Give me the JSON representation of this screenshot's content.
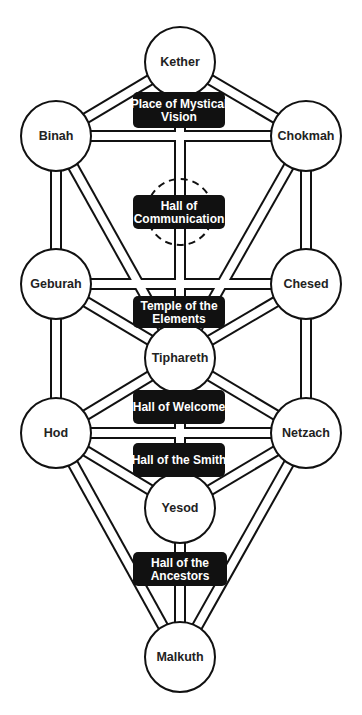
{
  "diagram": {
    "colors": {
      "line": "#111111",
      "fill": "#ffffff",
      "label_bg": "#111111",
      "label_text": "#ffffff",
      "node_text": "#222222"
    },
    "tube": {
      "outer_width": 12,
      "inner_width": 8
    },
    "nodes": [
      {
        "id": "kether",
        "label": "Kether",
        "cx": 180,
        "cy": 62,
        "r": 35
      },
      {
        "id": "binah",
        "label": "Binah",
        "cx": 56,
        "cy": 136,
        "r": 35
      },
      {
        "id": "chokmah",
        "label": "Chokmah",
        "cx": 306,
        "cy": 136,
        "r": 35
      },
      {
        "id": "geburah",
        "label": "Geburah",
        "cx": 56,
        "cy": 284,
        "r": 35
      },
      {
        "id": "chesed",
        "label": "Chesed",
        "cx": 306,
        "cy": 284,
        "r": 35
      },
      {
        "id": "tiphareth",
        "label": "Tiphareth",
        "cx": 180,
        "cy": 358,
        "r": 35
      },
      {
        "id": "hod",
        "label": "Hod",
        "cx": 56,
        "cy": 433,
        "r": 35
      },
      {
        "id": "netzach",
        "label": "Netzach",
        "cx": 306,
        "cy": 433,
        "r": 35
      },
      {
        "id": "yesod",
        "label": "Yesod",
        "cx": 180,
        "cy": 508,
        "r": 35
      },
      {
        "id": "malkuth",
        "label": "Malkuth",
        "cx": 180,
        "cy": 657,
        "r": 35
      }
    ],
    "paths": [
      [
        "kether",
        "binah"
      ],
      [
        "kether",
        "chokmah"
      ],
      [
        "kether",
        "tiphareth"
      ],
      [
        "binah",
        "chokmah"
      ],
      [
        "binah",
        "geburah"
      ],
      [
        "binah",
        "tiphareth"
      ],
      [
        "chokmah",
        "chesed"
      ],
      [
        "chokmah",
        "tiphareth"
      ],
      [
        "geburah",
        "chesed"
      ],
      [
        "geburah",
        "tiphareth"
      ],
      [
        "geburah",
        "hod"
      ],
      [
        "chesed",
        "tiphareth"
      ],
      [
        "chesed",
        "netzach"
      ],
      [
        "tiphareth",
        "hod"
      ],
      [
        "tiphareth",
        "netzach"
      ],
      [
        "tiphareth",
        "yesod"
      ],
      [
        "hod",
        "netzach"
      ],
      [
        "hod",
        "yesod"
      ],
      [
        "hod",
        "malkuth"
      ],
      [
        "netzach",
        "yesod"
      ],
      [
        "netzach",
        "malkuth"
      ],
      [
        "yesod",
        "malkuth"
      ]
    ],
    "hidden_node": {
      "id": "daath",
      "cx": 180,
      "cy": 212,
      "r": 33,
      "style": "dashed"
    },
    "halls": [
      {
        "id": "place-of-mystical-vision",
        "lines": [
          "Place of Mystical",
          "Vision"
        ],
        "x": 133,
        "y": 92,
        "w": 92,
        "h": 36
      },
      {
        "id": "hall-of-communication",
        "lines": [
          "Hall of",
          "Communication"
        ],
        "x": 133,
        "y": 195,
        "w": 92,
        "h": 34
      },
      {
        "id": "temple-of-the-elements",
        "lines": [
          "Temple of the",
          "Elements"
        ],
        "x": 133,
        "y": 296,
        "w": 92,
        "h": 32
      },
      {
        "id": "hall-of-welcome",
        "lines": [
          "Hall of Welcome"
        ],
        "x": 133,
        "y": 390,
        "w": 92,
        "h": 34
      },
      {
        "id": "hall-of-the-smith",
        "lines": [
          "Hall of the Smith"
        ],
        "x": 133,
        "y": 443,
        "w": 92,
        "h": 34
      },
      {
        "id": "hall-of-the-ancestors",
        "lines": [
          "Hall of the",
          "Ancestors"
        ],
        "x": 133,
        "y": 552,
        "w": 94,
        "h": 34
      }
    ]
  }
}
